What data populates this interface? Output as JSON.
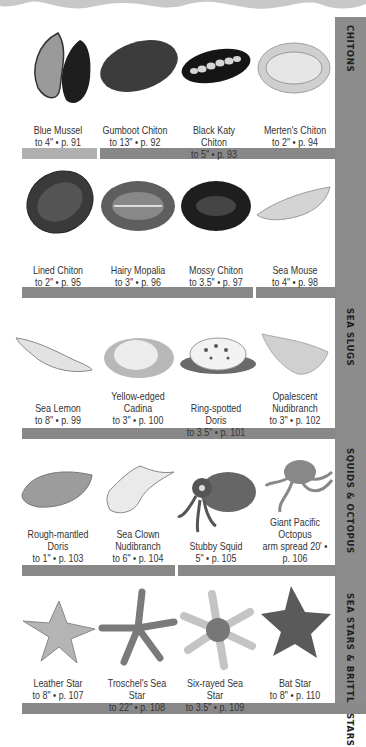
{
  "page": {
    "colors": {
      "tab_gray": "#8c8c8c",
      "bar_gray": "#888888",
      "bar_light": "#b0b0b0",
      "text": "#333333"
    }
  },
  "tabs": [
    {
      "label": "CHITONS"
    },
    {
      "label": "SEA SLUGS"
    },
    {
      "label": "SQUIDS & OCTOPUS"
    },
    {
      "label": "SEA STARS & BRITTLE STARS"
    }
  ],
  "rows": [
    {
      "species": [
        {
          "name": "Blue Mussel",
          "info": "to 4\" • p. 91",
          "icon": "mussel-illustration"
        },
        {
          "name": "Gumboot Chiton",
          "info": "to 13\" • p. 92",
          "icon": "chiton-illustration"
        },
        {
          "name": "Black Katy Chiton",
          "info": "to 5\" • p. 93",
          "icon": "chiton-illustration"
        },
        {
          "name": "Merten's Chiton",
          "info": "to 2\" • p. 94",
          "icon": "chiton-illustration"
        }
      ]
    },
    {
      "species": [
        {
          "name": "Lined Chiton",
          "info": "to 2\" • p. 95",
          "icon": "chiton-illustration"
        },
        {
          "name": "Hairy Mopalia",
          "info": "to 3\" • p. 96",
          "icon": "chiton-illustration"
        },
        {
          "name": "Mossy Chiton",
          "info": "to 3.5\" • p. 97",
          "icon": "chiton-illustration"
        },
        {
          "name": "Sea Mouse",
          "info": "to 4\" • p. 98",
          "icon": "sea-mouse-illustration"
        }
      ]
    },
    {
      "species": [
        {
          "name": "Sea Lemon",
          "info": "to 8\" • p. 99",
          "icon": "nudibranch-illustration"
        },
        {
          "name": "Yellow-edged Cadina",
          "info": "to 3\" • p. 100",
          "icon": "nudibranch-illustration"
        },
        {
          "name": "Ring-spotted Doris",
          "info": "to 3.5\" • p. 101",
          "icon": "nudibranch-illustration"
        },
        {
          "name": "Opalescent Nudibranch",
          "info": "to 3\" • p. 102",
          "icon": "nudibranch-illustration"
        }
      ]
    },
    {
      "species": [
        {
          "name": "Rough-mantled Doris",
          "info": "to 1\" • p. 103",
          "icon": "nudibranch-illustration"
        },
        {
          "name": "Sea Clown Nudibranch",
          "info": "to 6\" • p. 104",
          "icon": "nudibranch-illustration"
        },
        {
          "name": "Stubby Squid",
          "info": "5\" • p. 105",
          "icon": "squid-illustration"
        },
        {
          "name": "Giant Pacific Octopus",
          "info": "arm spread 20' • p. 106",
          "icon": "octopus-illustration"
        }
      ]
    },
    {
      "species": [
        {
          "name": "Leather Star",
          "info": "to 8\" • p. 107",
          "icon": "sea-star-illustration"
        },
        {
          "name": "Troschel's Sea Star",
          "info": "to 22\" • p. 108",
          "icon": "sea-star-illustration"
        },
        {
          "name": "Six-rayed Sea Star",
          "info": "to 3.5\" • p. 109",
          "icon": "sea-star-illustration"
        },
        {
          "name": "Bat Star",
          "info": "to 8\" • p. 110",
          "icon": "sea-star-illustration"
        }
      ]
    }
  ]
}
